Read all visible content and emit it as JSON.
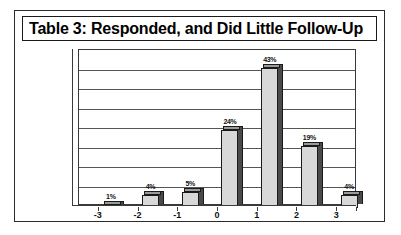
{
  "figure": {
    "title": "Table 3: Responded, and Did Little Follow-Up"
  },
  "chart_data": {
    "type": "bar",
    "title": "Table 3: Responded, and Did Little Follow-Up",
    "xlabel": "",
    "ylabel": "",
    "categories": [
      "-3",
      "-2",
      "-1",
      "0",
      "1",
      "2",
      "3"
    ],
    "values": [
      1,
      4,
      5,
      24,
      43,
      19,
      4
    ],
    "data_labels": [
      "1%",
      "4%",
      "5%",
      "24%",
      "43%",
      "19%",
      "4%"
    ],
    "ylim": [
      0,
      48
    ],
    "y_gridline_count": 8,
    "y_tick_labels": [],
    "grid": true,
    "legend": false,
    "legend_position": "none",
    "style": "3d-column",
    "colors": {
      "bar_face": "#d8d8d8",
      "bar_side": "#4a4a4a",
      "bar_top": "#9a9a9a",
      "bar_outline": "#1a1a1a",
      "gridline": "#555555",
      "axis": "#3a3a3a",
      "text": "#111111",
      "background": "#ffffff",
      "frame": "#2b2b2b"
    }
  }
}
